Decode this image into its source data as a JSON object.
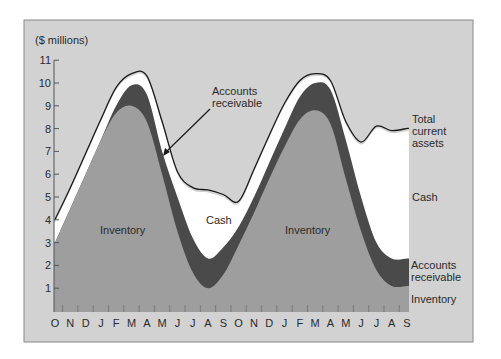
{
  "chart_data": {
    "type": "area",
    "title": "",
    "ylabel": "($ millions)",
    "xlabel": "",
    "ylim": [
      0,
      11
    ],
    "yticks": [
      1,
      2,
      3,
      4,
      5,
      6,
      7,
      8,
      9,
      10,
      11
    ],
    "categories": [
      "O",
      "N",
      "D",
      "J",
      "F",
      "M",
      "A",
      "M",
      "J",
      "J",
      "A",
      "S",
      "O",
      "N",
      "D",
      "J",
      "F",
      "M",
      "A",
      "M",
      "J",
      "J",
      "A",
      "S"
    ],
    "stacked": true,
    "series": [
      {
        "name": "Inventory",
        "color": "#9e9e9e",
        "values": [
          3.0,
          4.5,
          6.0,
          7.5,
          8.7,
          9.0,
          8.3,
          6.0,
          3.5,
          1.7,
          1.0,
          1.6,
          2.9,
          4.3,
          5.8,
          7.2,
          8.4,
          8.8,
          8.2,
          5.8,
          3.5,
          1.8,
          1.1,
          1.1
        ]
      },
      {
        "name": "Accounts receivable",
        "color": "#4a4a4a",
        "cumulative_values": [
          3.0,
          4.5,
          6.0,
          7.5,
          9.0,
          9.9,
          9.5,
          7.0,
          5.0,
          3.2,
          2.3,
          2.8,
          3.7,
          5.0,
          6.5,
          8.0,
          9.4,
          10.0,
          9.7,
          7.5,
          5.0,
          3.0,
          2.3,
          2.3
        ]
      },
      {
        "name": "Cash",
        "color": "#ffffff",
        "cumulative_values": [
          3.9,
          5.3,
          6.8,
          8.3,
          9.7,
          10.3,
          10.2,
          8.2,
          6.0,
          5.3,
          5.2,
          5.0,
          4.7,
          6.1,
          7.6,
          9.0,
          10.0,
          10.3,
          10.0,
          8.2,
          7.3,
          8.0,
          7.8,
          7.9
        ]
      }
    ],
    "total_line": {
      "name": "Total current assets",
      "values": [
        3.9,
        5.3,
        6.8,
        8.3,
        9.7,
        10.3,
        10.2,
        8.2,
        6.0,
        5.3,
        5.2,
        5.0,
        4.7,
        6.1,
        7.6,
        9.0,
        10.0,
        10.3,
        10.0,
        8.2,
        7.3,
        8.0,
        7.8,
        7.9
      ]
    },
    "annotations": [
      {
        "text": "Inventory",
        "at": "first cycle"
      },
      {
        "text": "Cash",
        "at": "first trough"
      },
      {
        "text": "Inventory",
        "at": "second cycle"
      },
      {
        "text": "Accounts receivable",
        "at": "arrow to first-cycle AR band"
      }
    ],
    "right_labels": [
      "Total current assets",
      "Cash",
      "Accounts receivable",
      "Inventory"
    ],
    "grid": false,
    "legend_position": "right (inline labels)"
  },
  "labels": {
    "unit": "($ millions)",
    "ar_callout_line1": "Accounts",
    "ar_callout_line2": "receivable",
    "inv_left": "Inventory",
    "cash_mid": "Cash",
    "inv_right": "Inventory",
    "right_total_1": "Total",
    "right_total_2": "current",
    "right_total_3": "assets",
    "right_cash": "Cash",
    "right_ar_1": "Accounts",
    "right_ar_2": "receivable",
    "right_inv": "Inventory"
  },
  "colors": {
    "frame_bg": "#d2d2d2",
    "inventory": "#9e9e9e",
    "receivables": "#4a4a4a",
    "cash": "#ffffff",
    "line": "#1a1a1a"
  }
}
